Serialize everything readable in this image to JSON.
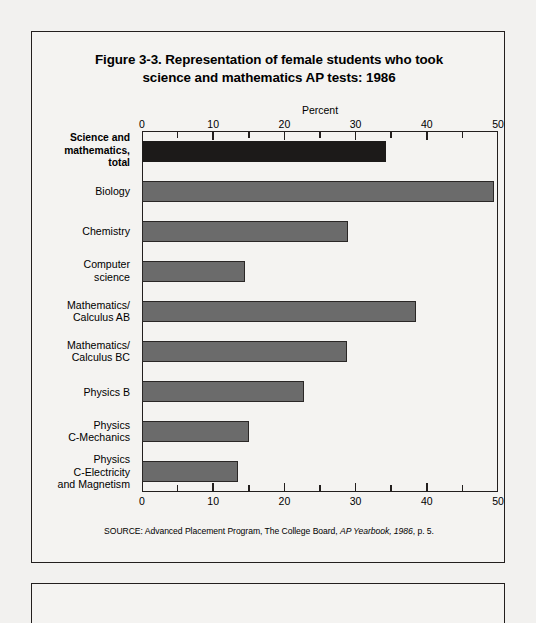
{
  "figure": {
    "title_line1": "Figure 3-3.  Representation of female students who took",
    "title_line2": "science and mathematics AP tests:  1986",
    "source_prefix": "SOURCE:  Advanced Placement Program, The College Board, ",
    "source_italic": "AP Yearbook, 1986",
    "source_suffix": ", p. 5."
  },
  "chart_data": {
    "type": "bar",
    "orientation": "horizontal",
    "title": "Figure 3-3.  Representation of female students who took science and mathematics AP tests:  1986",
    "xlabel": "Percent",
    "ylabel": "",
    "xlim": [
      0,
      50
    ],
    "xticks": [
      0,
      10,
      20,
      30,
      40,
      50
    ],
    "xtick_labels": [
      "0",
      "10",
      "20",
      "30",
      "40",
      "50"
    ],
    "minor_tick_interval": 5,
    "grid": false,
    "legend": null,
    "axis_position": "both-top-and-bottom",
    "categories": [
      "Science and mathematics, total",
      "Biology",
      "Chemistry",
      "Computer science",
      "Mathematics/ Calculus AB",
      "Mathematics/ Calculus BC",
      "Physics B",
      "Physics C-Mechanics",
      "Physics C-Electricity and Magnetism"
    ],
    "values": [
      34.3,
      49.5,
      29.0,
      14.4,
      38.5,
      28.8,
      22.8,
      15.0,
      13.5
    ],
    "bars": [
      {
        "label_lines": [
          "Science and",
          "mathematics,",
          "total"
        ],
        "value": 34.3,
        "emphasis": "total",
        "color": "#1c1a19"
      },
      {
        "label_lines": [
          "Biology"
        ],
        "value": 49.5,
        "emphasis": "normal",
        "color": "#6b6b6b"
      },
      {
        "label_lines": [
          "Chemistry"
        ],
        "value": 29.0,
        "emphasis": "normal",
        "color": "#6b6b6b"
      },
      {
        "label_lines": [
          "Computer",
          "science"
        ],
        "value": 14.4,
        "emphasis": "normal",
        "color": "#6b6b6b"
      },
      {
        "label_lines": [
          "Mathematics/",
          "Calculus AB"
        ],
        "value": 38.5,
        "emphasis": "normal",
        "color": "#6b6b6b"
      },
      {
        "label_lines": [
          "Mathematics/",
          "Calculus BC"
        ],
        "value": 28.8,
        "emphasis": "normal",
        "color": "#6b6b6b"
      },
      {
        "label_lines": [
          "Physics B"
        ],
        "value": 22.8,
        "emphasis": "normal",
        "color": "#6b6b6b"
      },
      {
        "label_lines": [
          "Physics",
          "C-Mechanics"
        ],
        "value": 15.0,
        "emphasis": "normal",
        "color": "#6b6b6b"
      },
      {
        "label_lines": [
          "Physics",
          "C-Electricity",
          "and Magnetism"
        ],
        "value": 13.5,
        "emphasis": "normal",
        "color": "#6b6b6b"
      }
    ]
  },
  "colors": {
    "total_bar": "#1c1a19",
    "bar": "#6b6b6b",
    "bar_outline": "#2a2726",
    "frame": "#231f1e",
    "page_background": "#f2f1ef",
    "figure_background": "#f4f3f1"
  }
}
